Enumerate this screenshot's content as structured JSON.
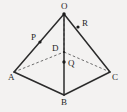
{
  "figure": {
    "kind": "square-pyramid-diagram",
    "background_color": "#f3f2f1",
    "edge_color": "#2b2b2b",
    "hidden_edge_color": "#5d5d5d",
    "label_color": "#1f1f1f",
    "vertices": [
      {
        "id": "O",
        "label": "O",
        "role": "apex",
        "x": 64,
        "y": 14,
        "label_x": 61,
        "label_y": 2,
        "dot": true
      },
      {
        "id": "A",
        "label": "A",
        "role": "base-vertex",
        "x": 14,
        "y": 72,
        "label_x": 8,
        "label_y": 73,
        "dot": false
      },
      {
        "id": "B",
        "label": "B",
        "role": "base-vertex",
        "x": 64,
        "y": 95,
        "label_x": 61,
        "label_y": 98,
        "dot": false
      },
      {
        "id": "C",
        "label": "C",
        "role": "base-vertex",
        "x": 110,
        "y": 72,
        "label_x": 112,
        "label_y": 73,
        "dot": false
      },
      {
        "id": "D",
        "label": "D",
        "role": "hidden-base-vertex",
        "x": 64,
        "y": 52,
        "label_x": 52,
        "label_y": 44,
        "dot": false
      }
    ],
    "marked_points": [
      {
        "id": "P",
        "label": "P",
        "on_edge": "OA",
        "x": 40,
        "y": 42,
        "label_x": 31,
        "label_y": 33
      },
      {
        "id": "R",
        "label": "R",
        "on_edge": "OC",
        "x": 78,
        "y": 27,
        "label_x": 82,
        "label_y": 19
      },
      {
        "id": "Q",
        "label": "Q",
        "on_edge": "OB",
        "x": 64,
        "y": 62,
        "label_x": 68,
        "label_y": 59
      }
    ],
    "edges_solid": [
      {
        "id": "OA",
        "from": "O",
        "to": "A"
      },
      {
        "id": "OB",
        "from": "O",
        "to": "B"
      },
      {
        "id": "OC",
        "from": "O",
        "to": "C"
      },
      {
        "id": "AB",
        "from": "A",
        "to": "B"
      },
      {
        "id": "BC",
        "from": "B",
        "to": "C"
      }
    ],
    "edges_dashed": [
      {
        "id": "AD",
        "from": "A",
        "to": "D"
      },
      {
        "id": "DC",
        "from": "D",
        "to": "C"
      },
      {
        "id": "OD",
        "from": "O",
        "to": "D"
      }
    ]
  }
}
